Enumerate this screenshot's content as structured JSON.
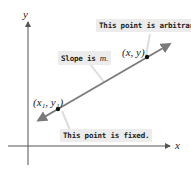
{
  "axes": {
    "x_label": "x",
    "y_label": "y"
  },
  "points": {
    "fixed": {
      "label": "(x₁, y₁)"
    },
    "arbitrary": {
      "label": "(x, y)"
    }
  },
  "callouts": {
    "arbitrary": "This point is arbitrary.",
    "slope_prefix": "Slope is ",
    "slope_var": "m.",
    "fixed": "This point is fixed."
  },
  "colors": {
    "line": "#7a7a7a",
    "axis": "#555555",
    "callout_bg": "#ececec"
  }
}
